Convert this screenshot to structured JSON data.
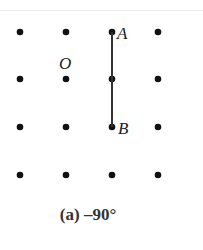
{
  "figure": {
    "grid": {
      "columns": [
        20,
        66,
        112,
        158
      ],
      "rows": [
        32,
        79,
        127,
        175
      ],
      "dot_color": "#111111"
    },
    "segment": {
      "from": "A",
      "to": "B",
      "color": "#333333"
    },
    "points": [
      {
        "label": "A",
        "x": 112,
        "y": 32
      },
      {
        "label": "B",
        "x": 112,
        "y": 127
      },
      {
        "label": "O",
        "x": 66,
        "y": 79
      }
    ],
    "caption": "(a) –90°"
  }
}
